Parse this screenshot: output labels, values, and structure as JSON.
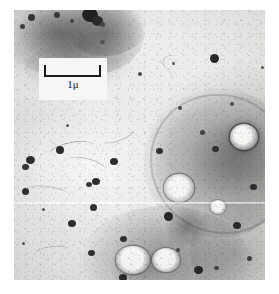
{
  "figure": {
    "kind": "electron-micrograph",
    "modality": "transmission electron microscopy",
    "alt": "Grayscale transmission electron micrograph of cell section showing dark electron-dense particles and membrane-bound vesicles"
  },
  "scale_bar": {
    "label": "1μ",
    "value": 1,
    "unit": "μ",
    "bar_length_px": 57,
    "style": "bracket",
    "box_background": "#f6f6f4",
    "line_color": "#1a1a1a"
  },
  "palette": {
    "plate_background": "#e8e8e6",
    "page_background": "#ffffff",
    "particle_dark": "#2b2b2b",
    "membrane_gray": "#8d8d8d",
    "vesicle_light": "#efefed"
  },
  "regions": [
    {
      "name": "dark-cytoplasmic-mass-top-left",
      "x": 18,
      "y": 6,
      "w": 110,
      "h": 64
    },
    {
      "name": "cell-body-right",
      "x": 150,
      "y": 95,
      "w": 115,
      "h": 130
    },
    {
      "name": "cell-body-bottom",
      "x": 80,
      "y": 205,
      "w": 140,
      "h": 80
    },
    {
      "name": "light-cytoplasm-center-left",
      "x": 16,
      "y": 110,
      "w": 130,
      "h": 110
    }
  ],
  "features": {
    "particles": [
      {
        "x": 30,
        "y": 22,
        "r": 3.4
      },
      {
        "x": 22,
        "y": 30,
        "r": 2.2
      },
      {
        "x": 58,
        "y": 18,
        "r": 3.0
      },
      {
        "x": 72,
        "y": 24,
        "r": 2.0
      },
      {
        "x": 92,
        "y": 14,
        "r": 6.5
      },
      {
        "x": 100,
        "y": 20,
        "r": 4.6
      },
      {
        "x": 86,
        "y": 22,
        "r": 3.2
      },
      {
        "x": 110,
        "y": 26,
        "r": 1.8
      },
      {
        "x": 212,
        "y": 54,
        "r": 4.2
      },
      {
        "x": 172,
        "y": 62,
        "r": 1.6
      },
      {
        "x": 262,
        "y": 66,
        "r": 1.4
      },
      {
        "x": 101,
        "y": 38,
        "r": 2.4
      },
      {
        "x": 56,
        "y": 148,
        "r": 3.6
      },
      {
        "x": 28,
        "y": 158,
        "r": 4.0
      },
      {
        "x": 24,
        "y": 166,
        "r": 3.2
      },
      {
        "x": 110,
        "y": 160,
        "r": 3.4
      },
      {
        "x": 66,
        "y": 126,
        "r": 1.6
      },
      {
        "x": 156,
        "y": 150,
        "r": 3.0
      },
      {
        "x": 22,
        "y": 190,
        "r": 3.2
      },
      {
        "x": 93,
        "y": 180,
        "r": 3.4
      },
      {
        "x": 88,
        "y": 182,
        "r": 2.4
      },
      {
        "x": 212,
        "y": 148,
        "r": 3.0
      },
      {
        "x": 252,
        "y": 186,
        "r": 3.2
      },
      {
        "x": 24,
        "y": 244,
        "r": 1.6
      },
      {
        "x": 68,
        "y": 222,
        "r": 3.4
      },
      {
        "x": 90,
        "y": 206,
        "r": 3.2
      },
      {
        "x": 120,
        "y": 238,
        "r": 3.0
      },
      {
        "x": 88,
        "y": 252,
        "r": 3.0
      },
      {
        "x": 166,
        "y": 216,
        "r": 4.2
      },
      {
        "x": 235,
        "y": 224,
        "r": 3.4
      },
      {
        "x": 196,
        "y": 268,
        "r": 4.0
      },
      {
        "x": 248,
        "y": 258,
        "r": 2.2
      },
      {
        "x": 120,
        "y": 276,
        "r": 3.4
      },
      {
        "x": 176,
        "y": 248,
        "r": 2.0
      },
      {
        "x": 214,
        "y": 268,
        "r": 2.2
      },
      {
        "x": 42,
        "y": 210,
        "r": 1.6
      }
    ],
    "vesicles": [
      {
        "x": 242,
        "y": 140,
        "rx": 13,
        "ry": 12,
        "name": "vesicle-upper-right"
      },
      {
        "x": 178,
        "y": 190,
        "rx": 14,
        "ry": 13,
        "name": "vesicle-mid-right"
      },
      {
        "x": 134,
        "y": 262,
        "rx": 16,
        "ry": 13,
        "name": "vesicle-bottom-left"
      },
      {
        "x": 166,
        "y": 262,
        "rx": 13,
        "ry": 11,
        "name": "vesicle-bottom-right"
      }
    ]
  }
}
